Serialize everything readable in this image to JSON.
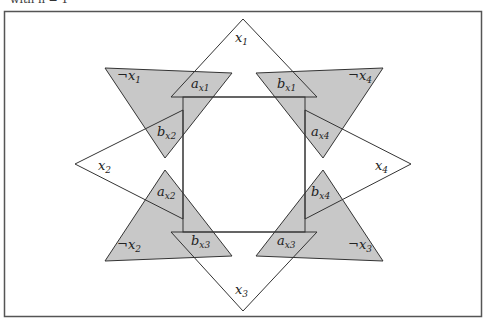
{
  "caption": "with n = 1",
  "colors": {
    "fill_gray": "#c8c8c8",
    "stroke": "#333333",
    "frame": "#555555"
  },
  "labels": {
    "x1": {
      "base": "x",
      "sub": "1"
    },
    "x2": {
      "base": "x",
      "sub": "2"
    },
    "x3": {
      "base": "x",
      "sub": "3"
    },
    "x4": {
      "base": "x",
      "sub": "4"
    },
    "not_x1": {
      "base": "¬x",
      "sub": "1"
    },
    "not_x2": {
      "base": "¬x",
      "sub": "2"
    },
    "not_x3": {
      "base": "¬x",
      "sub": "3"
    },
    "not_x4": {
      "base": "¬x",
      "sub": "4"
    },
    "a_x1": {
      "base": "a",
      "sub": "x1"
    },
    "b_x1": {
      "base": "b",
      "sub": "x1"
    },
    "a_x2": {
      "base": "a",
      "sub": "x2"
    },
    "b_x2": {
      "base": "b",
      "sub": "x2"
    },
    "a_x3": {
      "base": "a",
      "sub": "x3"
    },
    "b_x3": {
      "base": "b",
      "sub": "x3"
    },
    "a_x4": {
      "base": "a",
      "sub": "x4"
    },
    "b_x4": {
      "base": "b",
      "sub": "x4"
    }
  }
}
